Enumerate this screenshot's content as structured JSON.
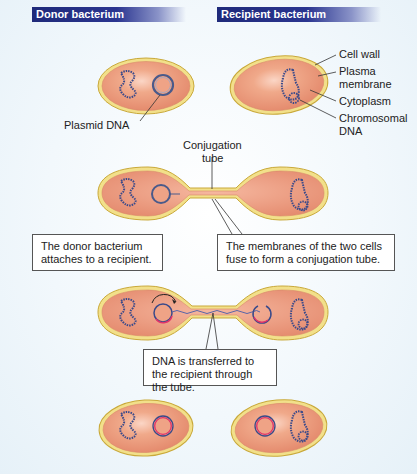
{
  "headers": {
    "donor": "Donor bacterium",
    "recipient": "Recipient bacterium"
  },
  "labels": {
    "cell_wall": "Cell wall",
    "plasma_membrane_1": "Plasma",
    "plasma_membrane_2": "membrane",
    "cytoplasm": "Cytoplasm",
    "chromosomal_dna_1": "Chromosomal",
    "chromosomal_dna_2": "DNA",
    "plasmid_dna": "Plasmid DNA",
    "conjugation_tube_1": "Conjugation",
    "conjugation_tube_2": "tube"
  },
  "captions": {
    "step1": "The donor bacterium attaches to a recipient.",
    "step2": "The membranes of the two cells fuse to form a conjugation tube.",
    "step3": "DNA is transferred to the recipient through the tube."
  },
  "colors": {
    "header_bg": "#1f2a7a",
    "cell_wall": "#e8d56a",
    "cytoplasm": "#eaa183",
    "dna": "#3a4a8a",
    "plasmid_new_strand": "#e0336a"
  }
}
